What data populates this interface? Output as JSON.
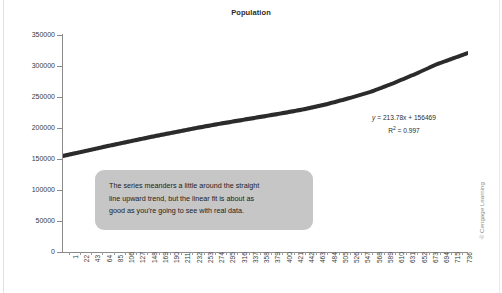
{
  "chart_data": {
    "type": "scatter",
    "title": "Population",
    "xlabel": "",
    "ylabel": "",
    "ylim": [
      0,
      350000
    ],
    "xlim": [
      1,
      736
    ],
    "grid": false,
    "legend": null,
    "y_ticks": [
      "0",
      "50000",
      "100000",
      "150000",
      "200000",
      "250000",
      "300000",
      "350000"
    ],
    "y_tick_values": [
      0,
      50000,
      100000,
      150000,
      200000,
      250000,
      300000,
      350000
    ],
    "x_tick_labels": [
      "1",
      "22",
      "43",
      "64",
      "85",
      "106",
      "127",
      "148",
      "169",
      "190",
      "211",
      "232",
      "253",
      "274",
      "295",
      "316",
      "337",
      "358",
      "379",
      "400",
      "421",
      "442",
      "463",
      "484",
      "505",
      "526",
      "547",
      "568",
      "589",
      "610",
      "631",
      "652",
      "673",
      "694",
      "715",
      "736"
    ],
    "series": [
      {
        "name": "Population",
        "color": "#2b2b2b",
        "x": [
          1,
          40,
          80,
          120,
          160,
          200,
          240,
          280,
          320,
          360,
          400,
          440,
          480,
          520,
          560,
          600,
          640,
          680,
          736
        ],
        "values": [
          155000,
          162500,
          170500,
          178000,
          185500,
          192500,
          199500,
          206000,
          212000,
          218000,
          224000,
          230500,
          238500,
          248000,
          258500,
          272000,
          287000,
          303000,
          321000
        ]
      }
    ],
    "trendline": {
      "equation": "y = 213.78x + 156469",
      "equation_slope": 213.78,
      "equation_intercept": 156469,
      "r_squared_label": "R2 = 0.997",
      "r_squared": 0.997
    },
    "annotations": [
      {
        "name": "callout",
        "lines": [
          "The series meanders a little around the straight",
          "line upward trend, but the linear fit is about as",
          "good as you’re going to see with real data."
        ],
        "background": "#c6c6c6"
      }
    ]
  },
  "equation": {
    "line1_prefix": "y",
    "line1_rest": " = 213.78x + 156469",
    "line2_prefix": "R",
    "line2_sup": "2",
    "line2_rest": " = 0.997"
  },
  "callout": {
    "line1": "The series meanders a little around the straight",
    "line2": "line upward trend, but the linear fit is about as",
    "line3": "good as you’re going to see with real data."
  },
  "footer": {
    "copyright": "© Cengage Learning"
  }
}
